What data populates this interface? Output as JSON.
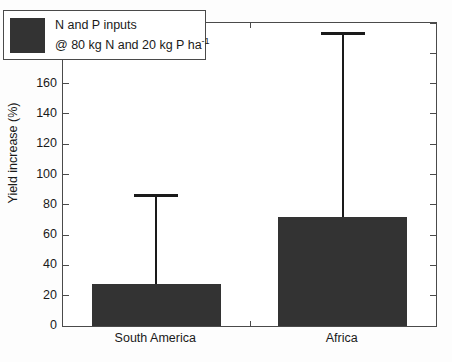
{
  "chart_data": {
    "type": "bar",
    "title": "",
    "xlabel": "",
    "ylabel": "Yield increase (%)",
    "categories": [
      "South America",
      "Africa"
    ],
    "values": [
      28,
      72
    ],
    "errors_upper": [
      87,
      194
    ],
    "error_type": "upper-whisker-only",
    "ylim": [
      0,
      200
    ],
    "yticks": [
      0,
      20,
      40,
      60,
      80,
      100,
      120,
      140,
      160,
      180,
      200
    ],
    "ytick_labels": [
      "0",
      "20",
      "40",
      "60",
      "80",
      "100",
      "120",
      "140",
      "160",
      "180",
      "200"
    ],
    "grid": false,
    "legend_position": "upper left",
    "series": [
      {
        "name": "N and P inputs @ 80 kg N and 20 kg P ha-1",
        "color": "#333333",
        "values": [
          28,
          72
        ]
      }
    ]
  },
  "legend": {
    "line1": "N and P inputs",
    "line2_prefix": "@ 80 kg N and 20 kg P ha",
    "line2_exponent": "-1",
    "swatch_color": "#333333"
  },
  "axes": {
    "y_title": "Yield increase (%)",
    "frame_color": "#4a4a4a"
  }
}
